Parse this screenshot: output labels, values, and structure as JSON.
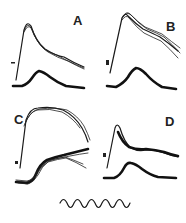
{
  "figure": {
    "panels": [
      {
        "id": "A",
        "label": "A"
      },
      {
        "id": "B",
        "label": "B"
      },
      {
        "id": "C",
        "label": "C"
      },
      {
        "id": "D",
        "label": "D"
      }
    ],
    "calibration": {
      "description": "sine-wave time calibration trace",
      "cycles": 5
    }
  }
}
